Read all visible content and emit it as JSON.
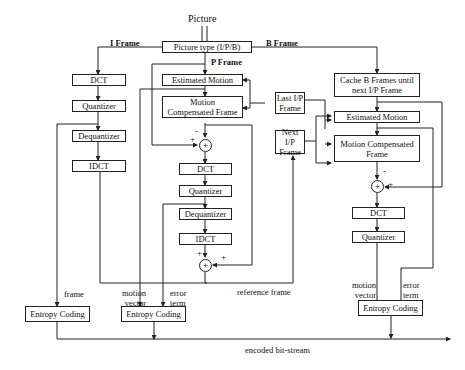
{
  "title": "Picture",
  "input_arrow": "⇓",
  "picture_type": "Picture type (I/P/B)",
  "branches": {
    "i": "I Frame",
    "p": "P Frame",
    "b": "B Frame"
  },
  "i_path": {
    "dct": "DCT",
    "quantizer": "Quantizer",
    "dequantizer": "Dequantizer",
    "idct": "IDCT",
    "frame_label": "frame",
    "entropy": "Entropy Coding"
  },
  "p_path": {
    "estimated_motion": "Estimated Motion",
    "motion_comp": "Motion Compensated Frame",
    "dct": "DCT",
    "quantizer": "Quantizer",
    "dequantizer": "Dequantizer",
    "idct": "IDCT",
    "motion_vector": "motion vector",
    "error_term": "error term",
    "reference_frame": "reference frame",
    "entropy": "Entropy Coding",
    "sum1": {
      "symbol": "+",
      "minus": "-",
      "plus": "+"
    },
    "sum2": {
      "symbol": "+",
      "plus1": "+",
      "plus2": "+"
    }
  },
  "frames": {
    "last": "Last I/P Frame",
    "next": "Next I/P Frame"
  },
  "b_path": {
    "cache": "Cache B Frames until next I/P Frame",
    "estimated_motion": "Estimated Motion",
    "motion_comp": "Motion Compensated Frame",
    "dct": "DCT",
    "quantizer": "Quantizer",
    "motion_vector": "motion vector",
    "error_term": "error term",
    "entropy": "Entropy Coding",
    "sum": {
      "symbol": "+",
      "minus": "-",
      "plus": "+"
    }
  },
  "output": "encoded bit-stream"
}
